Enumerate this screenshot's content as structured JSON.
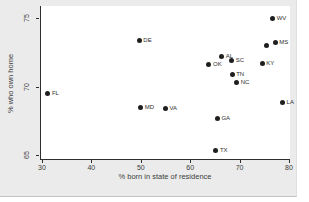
{
  "chart_data": {
    "type": "scatter",
    "title": "",
    "xlabel": "% born in state of residence",
    "ylabel": "% who own home",
    "xlim": [
      29.6,
      80.0
    ],
    "ylim": [
      64.7,
      75.9
    ],
    "x_ticks": [
      30,
      40,
      50,
      60,
      70,
      80
    ],
    "y_ticks": [
      65,
      70,
      75
    ],
    "grid": false,
    "legend": "none",
    "marker_color": "#1f1f1f",
    "graph_background": "#ebebeb",
    "plot_background": "#ffffff",
    "points": [
      {
        "label": "WV",
        "x": 76.5,
        "y": 75.0
      },
      {
        "label": "DE",
        "x": 49.5,
        "y": 73.4
      },
      {
        "label": "MS",
        "x": 77.0,
        "y": 73.2
      },
      {
        "label": "",
        "x": 75.2,
        "y": 73.0
      },
      {
        "label": "AL",
        "x": 66.2,
        "y": 72.2
      },
      {
        "label": "SC",
        "x": 68.2,
        "y": 71.9
      },
      {
        "label": "KY",
        "x": 74.4,
        "y": 71.7
      },
      {
        "label": "OK",
        "x": 63.6,
        "y": 71.6
      },
      {
        "label": "TN",
        "x": 68.3,
        "y": 70.9
      },
      {
        "label": "NC",
        "x": 69.2,
        "y": 70.3
      },
      {
        "label": "FL",
        "x": 31.0,
        "y": 69.5
      },
      {
        "label": "LA",
        "x": 78.5,
        "y": 68.8
      },
      {
        "label": "MD",
        "x": 49.8,
        "y": 68.5
      },
      {
        "label": "VA",
        "x": 54.8,
        "y": 68.4
      },
      {
        "label": "GA",
        "x": 65.3,
        "y": 67.7
      },
      {
        "label": "TX",
        "x": 65.0,
        "y": 65.3
      }
    ]
  }
}
